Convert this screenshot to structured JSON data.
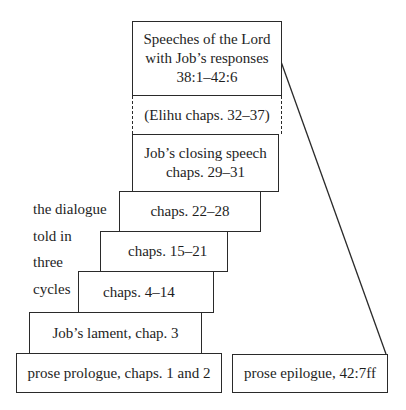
{
  "diagram": {
    "boxes": {
      "lord_speeches": {
        "line1": "Speeches of the Lord",
        "line2": "with Job’s responses",
        "line3": "38:1–42:6"
      },
      "elihu": {
        "label": "(Elihu chaps. 32–37)"
      },
      "closing_speech": {
        "line1": "Job’s closing speech",
        "line2": "chaps. 29–31"
      },
      "cycle3": {
        "label": "chaps. 22–28"
      },
      "cycle2": {
        "label": "chaps. 15–21"
      },
      "cycle1": {
        "label": "chaps. 4–14"
      },
      "lament": {
        "label": "Job’s lament, chap. 3"
      },
      "prologue": {
        "label": "prose prologue, chaps. 1 and 2"
      },
      "epilogue": {
        "label": "prose epilogue, 42:7ff"
      }
    },
    "side_label": {
      "lines": [
        "the dialogue",
        "told in",
        "three",
        "cycles"
      ]
    },
    "colors": {
      "line": "#2a2a2a",
      "background": "#ffffff",
      "text": "#1e1e1e"
    }
  }
}
